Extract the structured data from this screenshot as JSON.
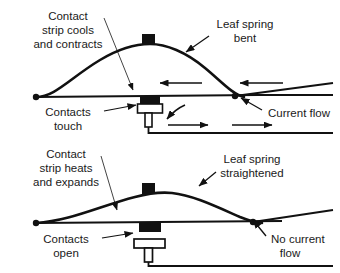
{
  "diagram": {
    "type": "bimetallic-thermostat-switch",
    "colors": {
      "ink": "#111111",
      "stroke": "#111111",
      "background": "#ffffff",
      "contact_block": "#111111"
    },
    "panels": [
      {
        "id": "closed-state",
        "name": "contacts-closed-panel",
        "labels": {
          "left": {
            "name": "contact-strip-cools-label",
            "lines": [
              "Contact",
              "strip cools",
              "and contracts"
            ]
          },
          "right": {
            "name": "leaf-spring-bent-label",
            "lines": [
              "Leaf spring",
              "bent"
            ]
          },
          "bottom_left": {
            "name": "contacts-touch-label",
            "lines": [
              "Contacts",
              "touch"
            ]
          },
          "bottom_right": {
            "name": "current-flow-label",
            "lines": [
              "Current flow"
            ]
          }
        },
        "current_flow_direction_upper": "left",
        "current_flow_direction_lower": "right",
        "arrow_count_upper": 2,
        "arrow_count_lower": 2
      },
      {
        "id": "open-state",
        "name": "contacts-open-panel",
        "labels": {
          "left": {
            "name": "contact-strip-heats-label",
            "lines": [
              "Contact",
              "strip heats",
              "and expands"
            ]
          },
          "right": {
            "name": "leaf-spring-straightened-label",
            "lines": [
              "Leaf spring",
              "straightened"
            ]
          },
          "bottom_left": {
            "name": "contacts-open-label",
            "lines": [
              "Contacts",
              "open"
            ]
          },
          "bottom_right": {
            "name": "no-current-flow-label",
            "lines": [
              "No current",
              "flow"
            ]
          }
        },
        "current_flow_direction_upper": "none",
        "current_flow_direction_lower": "none",
        "arrow_count_upper": 0,
        "arrow_count_lower": 0
      }
    ]
  },
  "text": {
    "p1_left_1": "Contact",
    "p1_left_2": "strip cools",
    "p1_left_3": "and contracts",
    "p1_right_1": "Leaf spring",
    "p1_right_2": "bent",
    "p1_bl_1": "Contacts",
    "p1_bl_2": "touch",
    "p1_br_1": "Current flow",
    "p2_left_1": "Contact",
    "p2_left_2": "strip heats",
    "p2_left_3": "and expands",
    "p2_right_1": "Leaf spring",
    "p2_right_2": "straightened",
    "p2_bl_1": "Contacts",
    "p2_bl_2": "open",
    "p2_br_1": "No current",
    "p2_br_2": "flow"
  }
}
